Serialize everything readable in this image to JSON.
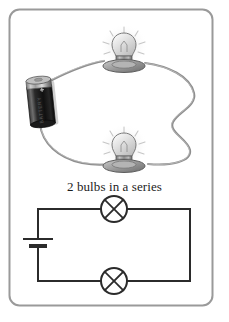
{
  "figure": {
    "caption": "2 bulbs in a series",
    "border": {
      "color": "#9a9a9a",
      "width": 2,
      "corner_radius": 10
    },
    "background_color": "#ffffff"
  },
  "pictorial_circuit": {
    "name": "pictorial series circuit with battery and two bulbs",
    "wire_color": "#8c8c8c",
    "battery": {
      "label": "D-cell battery",
      "body_color": "#141414",
      "cap_color": "#b4b4b4",
      "terminal_label": "+"
    },
    "bulbs": [
      {
        "label": "lit light bulb",
        "position": "top",
        "glass_color": "#d8d8d8",
        "base_color": "#8f8f8f",
        "glow_color": "#f2f2f2"
      },
      {
        "label": "lit light bulb",
        "position": "bottom",
        "glass_color": "#d8d8d8",
        "base_color": "#8f8f8f",
        "glow_color": "#f2f2f2"
      }
    ]
  },
  "schematic_circuit": {
    "name": "series circuit schematic",
    "line_color": "#2b2b2b",
    "line_width": 2,
    "cell_symbol": {
      "label": "cell",
      "long_plate_label": "positive terminal",
      "short_plate_label": "negative terminal"
    },
    "lamp_symbols": [
      {
        "label": "lamp",
        "position": "top rail",
        "glyph": "circle-with-cross"
      },
      {
        "label": "lamp",
        "position": "bottom rail",
        "glyph": "circle-with-cross"
      }
    ]
  }
}
